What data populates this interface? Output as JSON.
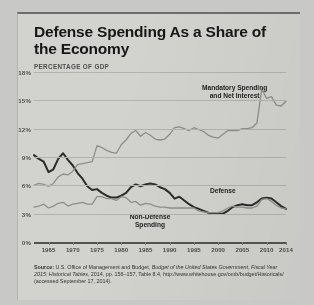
{
  "title": "Defense Spending As a Share of the Economy",
  "axis_title": "PERCENTAGE OF GDP",
  "annotations": {
    "mandatory": "Mandatory Spending\nand Net Interest",
    "defense": "Defense",
    "nondefense": "Non-Defense\nSpending"
  },
  "source": {
    "label": "Source:",
    "text_1": " U.S. Office of Management and Budget, ",
    "italic_1": "Budget of the United States Government,",
    "italic_2": "Fiscal Year 2015: Historical Tables,",
    "text_2": " 2014, pp. 156–157, Table 8.4, http://www.whitehouse.gov/omb/budget/Historicals/ (accessed September 17, 2014)."
  },
  "chart_data": {
    "type": "line",
    "title": "Defense Spending As a Share of the Economy",
    "xlabel": "",
    "ylabel": "PERCENTAGE OF GDP",
    "xlim": [
      1962,
      2014
    ],
    "ylim": [
      0,
      18
    ],
    "ytick_labels": [
      "0%",
      "3%",
      "6%",
      "9%",
      "12%",
      "15%",
      "18%"
    ],
    "yticks": [
      0,
      3,
      6,
      9,
      12,
      15,
      18
    ],
    "xtick_labels": [
      "1965",
      "1970",
      "1975",
      "1980",
      "1985",
      "1990",
      "1995",
      "2000",
      "2005",
      "2010",
      "2014"
    ],
    "xticks": [
      1965,
      1970,
      1975,
      1980,
      1985,
      1990,
      1995,
      2000,
      2005,
      2010,
      2014
    ],
    "grid": true,
    "legend": "inline-annotations",
    "colors": {
      "defense": "#2b2b2b",
      "nondefense": "#8e8e8a",
      "mandatory": "#8e8e8a",
      "gridline": "#b3b3ae",
      "axis": "#53534f",
      "paper": "#d2d2cf"
    },
    "x": [
      1962,
      1963,
      1964,
      1965,
      1966,
      1967,
      1968,
      1969,
      1970,
      1971,
      1972,
      1973,
      1974,
      1975,
      1976,
      1977,
      1978,
      1979,
      1980,
      1981,
      1982,
      1983,
      1984,
      1985,
      1986,
      1987,
      1988,
      1989,
      1990,
      1991,
      1992,
      1993,
      1994,
      1995,
      1996,
      1997,
      1998,
      1999,
      2000,
      2001,
      2002,
      2003,
      2004,
      2005,
      2006,
      2007,
      2008,
      2009,
      2010,
      2011,
      2012,
      2013,
      2014
    ],
    "series": [
      {
        "name": "Defense",
        "values": [
          9.2,
          8.8,
          8.5,
          7.4,
          7.7,
          8.8,
          9.4,
          8.7,
          8.1,
          7.3,
          6.7,
          5.9,
          5.5,
          5.6,
          5.2,
          4.9,
          4.7,
          4.7,
          4.9,
          5.2,
          5.8,
          6.1,
          5.9,
          6.1,
          6.2,
          6.1,
          5.8,
          5.6,
          5.2,
          4.6,
          4.8,
          4.4,
          4.0,
          3.7,
          3.5,
          3.3,
          3.1,
          3.0,
          3.0,
          3.0,
          3.3,
          3.7,
          3.9,
          4.0,
          3.9,
          3.9,
          4.2,
          4.6,
          4.7,
          4.6,
          4.2,
          3.8,
          3.5
        ]
      },
      {
        "name": "Non-Defense Spending",
        "values": [
          3.7,
          3.8,
          4.0,
          3.6,
          3.8,
          4.1,
          4.2,
          3.8,
          4.0,
          4.1,
          4.2,
          4.0,
          4.0,
          4.8,
          4.8,
          4.6,
          4.6,
          4.4,
          4.8,
          4.7,
          4.2,
          4.3,
          3.9,
          4.1,
          4.0,
          3.8,
          3.7,
          3.7,
          3.6,
          3.6,
          3.6,
          3.6,
          3.6,
          3.6,
          3.3,
          3.2,
          3.1,
          3.1,
          3.1,
          3.3,
          3.6,
          3.8,
          3.7,
          3.7,
          3.6,
          3.6,
          3.8,
          4.5,
          4.6,
          4.3,
          3.9,
          3.6,
          3.5
        ]
      },
      {
        "name": "Mandatory Spending and Net Interest",
        "values": [
          6.0,
          6.2,
          6.1,
          5.9,
          6.2,
          6.9,
          7.2,
          7.1,
          7.5,
          8.2,
          8.3,
          8.4,
          8.5,
          10.2,
          10.0,
          9.7,
          9.5,
          9.4,
          10.3,
          10.8,
          11.5,
          11.8,
          11.2,
          11.6,
          11.3,
          10.9,
          10.8,
          10.9,
          11.4,
          12.1,
          12.2,
          12.0,
          11.8,
          12.1,
          11.9,
          11.7,
          11.3,
          11.1,
          11.0,
          11.4,
          11.8,
          11.8,
          11.8,
          12.0,
          12.0,
          12.1,
          12.6,
          16.2,
          15.2,
          15.4,
          14.5,
          14.4,
          14.9
        ]
      }
    ]
  }
}
